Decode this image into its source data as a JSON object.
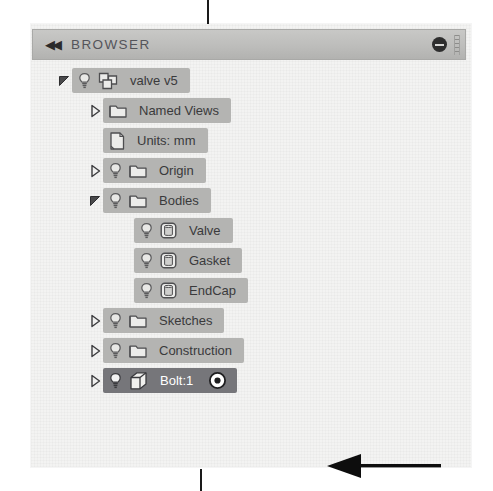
{
  "panel": {
    "title": "BROWSER",
    "collapse_icon": "double-chevron-left-icon",
    "minimize_icon": "minimize-icon",
    "grip_icon": "resize-grip-icon",
    "colors": {
      "titlebar": "#bdbdbb",
      "row": "#b4b4b2",
      "row_selected": "#76767a",
      "background": "#f3f3f2",
      "text": "#3a3a3c",
      "text_selected": "#ffffff"
    }
  },
  "tree": {
    "items": [
      {
        "label": "valve v5",
        "indent": 0,
        "twisty": "expanded",
        "bulb": true,
        "icon": "component-icon",
        "selected": false,
        "target": false
      },
      {
        "label": "Named Views",
        "indent": 1,
        "twisty": "collapsed",
        "bulb": false,
        "icon": "folder-icon",
        "selected": false,
        "target": false
      },
      {
        "label": "Units: mm",
        "indent": 1,
        "twisty": "none",
        "bulb": false,
        "icon": "document-icon",
        "selected": false,
        "target": false
      },
      {
        "label": "Origin",
        "indent": 1,
        "twisty": "collapsed",
        "bulb": true,
        "icon": "folder-icon",
        "selected": false,
        "target": false
      },
      {
        "label": "Bodies",
        "indent": 1,
        "twisty": "expanded",
        "bulb": true,
        "icon": "folder-icon",
        "selected": false,
        "target": false
      },
      {
        "label": "Valve",
        "indent": 2,
        "twisty": "none",
        "bulb": true,
        "icon": "body-icon",
        "selected": false,
        "target": false
      },
      {
        "label": "Gasket",
        "indent": 2,
        "twisty": "none",
        "bulb": true,
        "icon": "body-icon",
        "selected": false,
        "target": false
      },
      {
        "label": "EndCap",
        "indent": 2,
        "twisty": "none",
        "bulb": true,
        "icon": "body-icon",
        "selected": false,
        "target": false
      },
      {
        "label": "Sketches",
        "indent": 1,
        "twisty": "collapsed",
        "bulb": true,
        "icon": "folder-icon",
        "selected": false,
        "target": false
      },
      {
        "label": "Construction",
        "indent": 1,
        "twisty": "collapsed",
        "bulb": true,
        "icon": "folder-icon",
        "selected": false,
        "target": false
      },
      {
        "label": "Bolt:1",
        "indent": 1,
        "twisty": "collapsed",
        "bulb": true,
        "icon": "occurrence-icon",
        "selected": true,
        "target": true
      }
    ]
  },
  "annotation": {
    "arrow": "pointer-arrow-left",
    "points_at": "Bolt:1"
  }
}
